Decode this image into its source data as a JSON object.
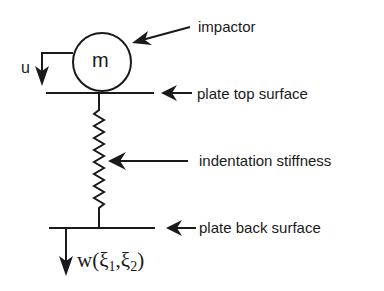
{
  "diagram": {
    "type": "impact-model-schematic",
    "mass": {
      "symbol": "m"
    },
    "displacement_mass": {
      "symbol": "u"
    },
    "displacement_plate": {
      "text": "w(",
      "xi1": "ξ",
      "sub1": "1",
      "sep": ",",
      "xi2": "ξ",
      "sub2": "2",
      "close": ")"
    },
    "labels": {
      "impactor": "impactor",
      "plate_top": "plate top surface",
      "stiffness": "indentation stiffness",
      "plate_back": "plate back surface"
    },
    "colors": {
      "ink": "#1a1a1a",
      "background": "#ffffff"
    }
  }
}
